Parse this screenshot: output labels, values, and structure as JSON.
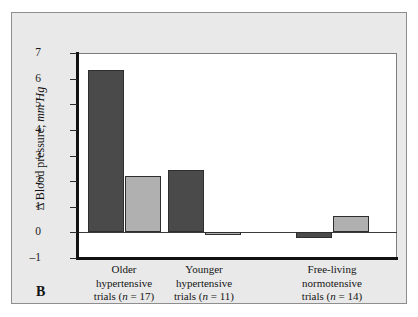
{
  "panel": {
    "letter": "B"
  },
  "chart_data": {
    "type": "bar",
    "title": "",
    "subtitle": "",
    "xlabel": "",
    "ylabel": "Δ Blood pressure, mm Hg",
    "ylabel_plain": "Δ Blood pressure,",
    "ylabel_unit": "mm Hg",
    "ylim": [
      -1,
      7
    ],
    "yticks": [
      7,
      6,
      5,
      4,
      3,
      2,
      1,
      0,
      -1
    ],
    "ytick_labels": [
      "7",
      "6",
      "5",
      "4",
      "3",
      "2",
      "1",
      "0",
      "–1"
    ],
    "grid": false,
    "legend": "none",
    "zero_line": 0,
    "categories": [
      "Older hypertensive trials (n = 17)",
      "Younger hypertensive trials (n = 11)",
      "Free-living normotensive trials (n = 14)"
    ],
    "category_lines": [
      [
        "Older",
        "hypertensive",
        "trials (n = 17)"
      ],
      [
        "Younger",
        "hypertensive",
        "trials (n = 11)"
      ],
      [
        "Free-living",
        "normotensive",
        "trials (n = 14)"
      ]
    ],
    "series": [
      {
        "name": "dark-series",
        "color": "#4a4a4a",
        "values": [
          6.33,
          2.42,
          -0.2
        ]
      },
      {
        "name": "light-series",
        "color": "#b0b0b0",
        "values": [
          2.19,
          -0.1,
          0.65
        ]
      }
    ]
  },
  "colors": {
    "dark_bar": "#4a4a4a",
    "light_bar": "#b0b0b0",
    "plate_background": "#e9e9e9",
    "plot_background": "#ffffff",
    "axis": "#111111",
    "frame_border": "#8e8e8e"
  }
}
